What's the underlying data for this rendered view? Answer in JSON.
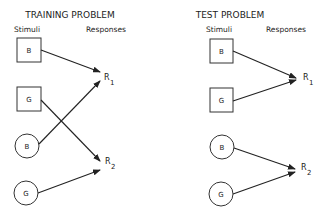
{
  "panels": [
    {
      "title": "TRAINING PROBLEM",
      "stimuli_label": "Stimuli",
      "responses_label": "Responses",
      "stimuli": [
        {
          "shape": "square",
          "label": "B"
        },
        {
          "shape": "square",
          "label": "G"
        },
        {
          "shape": "circle",
          "label": "B"
        },
        {
          "shape": "circle",
          "label": "G"
        }
      ],
      "responses": [
        {
          "label": "R",
          "sub": "1"
        },
        {
          "label": "R",
          "sub": "2"
        }
      ],
      "arrows": [
        {
          "from": "square B",
          "to": "R1"
        },
        {
          "from": "square G",
          "to": "R2"
        },
        {
          "from": "circle B",
          "to": "R1"
        },
        {
          "from": "circle G",
          "to": "R2"
        }
      ]
    },
    {
      "title": "TEST PROBLEM",
      "stimuli_label": "Stimuli",
      "responses_label": "Responses",
      "stimuli": [
        {
          "shape": "square",
          "label": "B"
        },
        {
          "shape": "square",
          "label": "G"
        },
        {
          "shape": "circle",
          "label": "B"
        },
        {
          "shape": "circle",
          "label": "G"
        }
      ],
      "responses": [
        {
          "label": "R",
          "sub": "1"
        },
        {
          "label": "R",
          "sub": "2"
        }
      ],
      "arrows": [
        {
          "from": "square B",
          "to": "R1"
        },
        {
          "from": "square G",
          "to": "R1"
        },
        {
          "from": "circle B",
          "to": "R2"
        },
        {
          "from": "circle G",
          "to": "R2"
        }
      ]
    }
  ]
}
